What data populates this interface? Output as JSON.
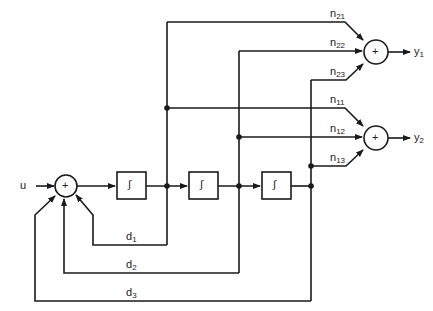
{
  "diagram": {
    "type": "block-diagram",
    "input": "u",
    "outputs": [
      {
        "name": "y",
        "sub": "1"
      },
      {
        "name": "y",
        "sub": "2"
      }
    ],
    "sum_symbol": "+",
    "integrator_symbol": "∫",
    "feedback_gains": [
      {
        "name": "d",
        "sub": "1"
      },
      {
        "name": "d",
        "sub": "2"
      },
      {
        "name": "d",
        "sub": "3"
      }
    ],
    "output_gains": [
      {
        "name": "n",
        "sub": "21"
      },
      {
        "name": "n",
        "sub": "22"
      },
      {
        "name": "n",
        "sub": "23"
      },
      {
        "name": "n",
        "sub": "11"
      },
      {
        "name": "n",
        "sub": "12"
      },
      {
        "name": "n",
        "sub": "13"
      }
    ],
    "line_color": "#1a1a1a"
  }
}
